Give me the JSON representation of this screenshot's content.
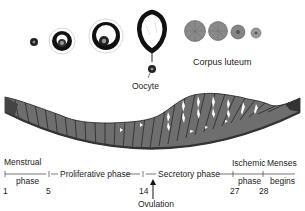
{
  "diagram": {
    "labels": {
      "oocyte": "Oocyte",
      "corpus_luteum": "Corpus luteum",
      "ovulation": "Ovulation"
    },
    "phases": [
      {
        "line1": "Menstrual",
        "line2": "phase"
      },
      {
        "line1": "Proliferative phase"
      },
      {
        "line1": "Secretory phase"
      },
      {
        "line1": "Ischemic",
        "line2": "phase"
      },
      {
        "line1": "Menses",
        "line2": "begins"
      }
    ],
    "days": [
      "1",
      "5",
      "14",
      "27",
      "28"
    ],
    "colors": {
      "endometrium": "#6e6e6e",
      "endometrium_dark": "#3a3a3a",
      "follicle_ring": "#111111",
      "corpus_luteum": "#8a8a8a",
      "timeline": "#555555"
    }
  }
}
